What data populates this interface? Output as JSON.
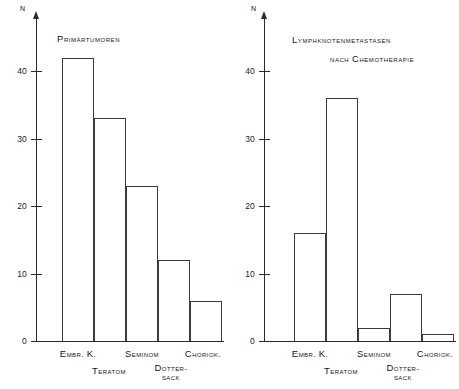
{
  "figure": {
    "background": "#ffffff",
    "ink_color": "#2a2a2a"
  },
  "chart_data": [
    {
      "type": "bar",
      "title": "Primärtumoren",
      "panel": "left",
      "categories": [
        "Embr. K.",
        "Teratom",
        "Seminom",
        "Dotter-sack",
        "Choriok."
      ],
      "category_rows": [
        0,
        1,
        0,
        1,
        0
      ],
      "values": [
        42,
        33,
        23,
        12,
        6
      ],
      "xlabel": "",
      "ylabel": "N",
      "ylim": [
        0,
        47
      ],
      "yticks": [
        0,
        10,
        20,
        30,
        40
      ],
      "ytick_labels": [
        "0",
        "10",
        "20",
        "30",
        "40"
      ],
      "grid": false,
      "legend": "none"
    },
    {
      "type": "bar",
      "title": "Lymphknotenmetastasen nach Chemotherapie",
      "title_line1": "Lymphknotenmetastasen",
      "title_line2": "nach Chemotherapie",
      "panel": "right",
      "categories": [
        "Embr. K.",
        "Teratom",
        "Seminom",
        "Dotter-sack",
        "Choriok."
      ],
      "category_rows": [
        0,
        1,
        0,
        1,
        0
      ],
      "values": [
        16,
        36,
        2,
        7,
        1
      ],
      "xlabel": "",
      "ylabel": "N",
      "ylim": [
        0,
        47
      ],
      "yticks": [
        0,
        10,
        20,
        30,
        40
      ],
      "ytick_labels": [
        "0",
        "10",
        "20",
        "30",
        "40"
      ],
      "grid": false,
      "legend": "none"
    }
  ],
  "left_chart": {
    "title": "Primärtumoren",
    "axis_name": "N",
    "ticks": [
      "0",
      "10",
      "20",
      "30",
      "40"
    ],
    "cats": {
      "c0": "Embr. K.",
      "c1": "Teratom",
      "c2": "Seminom",
      "c3a": "Dotter-",
      "c3b": "sack",
      "c4": "Choriok."
    }
  },
  "right_chart": {
    "title_line1": "Lymphknotenmetastasen",
    "title_line2": "nach Chemotherapie",
    "axis_name": "N",
    "ticks": [
      "0",
      "10",
      "20",
      "30",
      "40"
    ],
    "cats": {
      "c0": "Embr. K.",
      "c1": "Teratom",
      "c2": "Seminom",
      "c3a": "Dotter-",
      "c3b": "sack",
      "c4": "Choriok."
    }
  }
}
